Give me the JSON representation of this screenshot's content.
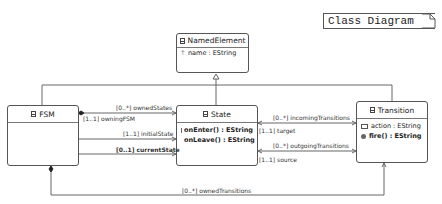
{
  "title_note": "Class Diagram",
  "classes": {
    "named_element": {
      "name": "NamedElement",
      "attributes": [
        "name : EString"
      ],
      "operations": []
    },
    "fsm": {
      "name": "FSM",
      "attributes": [],
      "operations": []
    },
    "state": {
      "name": "State",
      "attributes": [],
      "operations": [
        "onEnter() : EString",
        "onLeave() : EString"
      ]
    },
    "transition": {
      "name": "Transition",
      "attributes": [
        "action : EString"
      ],
      "operations": [
        "fire() : EString"
      ]
    }
  },
  "associations": {
    "owned_states": "[0..*] ownedStates",
    "owning_fsm": "[1..1] owningFSM",
    "initial_state": "[1..1] initialState",
    "current_state": "[0..1] currentState",
    "incoming_transitions": "[0..*] incomingTransitions",
    "target": "[1..1] target",
    "outgoing_transitions": "[0..*] outgoingTransitions",
    "source": "[1..1] source",
    "owned_transitions": "[0..*] ownedTransitions"
  },
  "colors": {
    "line": "#555555",
    "border": "#555555"
  }
}
